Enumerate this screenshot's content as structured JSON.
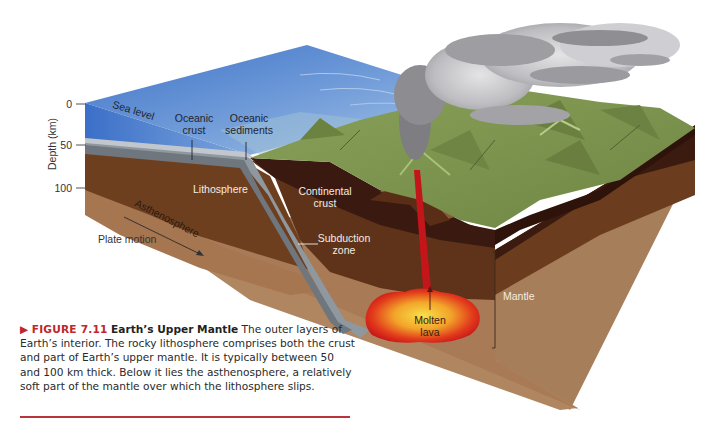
{
  "figure": {
    "marker": "▶",
    "number": "FIGURE 7.11",
    "title": "Earth’s Upper Mantle",
    "caption": "The outer layers of Earth’s interior. The rocky lithosphere comprises both the crust and part of Earth’s upper mantle. It is typically between 50 and 100 km thick. Below it lies the asthenosphere, a relatively soft part of the mantle over which the lithosphere slips."
  },
  "depth_axis": {
    "title": "Depth (km)",
    "ticks": [
      "0",
      "50",
      "100"
    ]
  },
  "labels": {
    "sea_level": "Sea level",
    "oceanic_crust_1": "Oceanic",
    "oceanic_crust_2": "crust",
    "oceanic_sediments_1": "Oceanic",
    "oceanic_sediments_2": "sediments",
    "lithosphere": "Lithosphere",
    "asthenosphere": "Asthenosphere",
    "plate_motion": "Plate motion",
    "continental_crust_1": "Continental",
    "continental_crust_2": "crust",
    "subduction_zone_1": "Subduction",
    "subduction_zone_2": "zone",
    "molten_lava_1": "Molten",
    "molten_lava_2": "lava",
    "mantle": "Mantle"
  },
  "colors": {
    "ocean": "#4a7fd0",
    "ocean_light": "#8fb3e6",
    "oceanic_crust": "#9aa2ab",
    "lithosphere": "#6e3f1f",
    "continental_crust": "#3a1a10",
    "asthenosphere": "#a87a55",
    "mantle_lower": "#b08a66",
    "land": "#7f9450",
    "lava_core": "#f4d23a",
    "lava_edge": "#d8201c",
    "smoke": "#a9a9ad",
    "caption_accent": "#c0262c"
  }
}
